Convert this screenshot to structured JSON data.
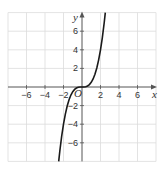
{
  "chart_data": {
    "type": "line",
    "title": "",
    "xlabel": "x",
    "ylabel": "y",
    "origin_label": "O",
    "xlim": [
      -8,
      8
    ],
    "ylim": [
      -8,
      8
    ],
    "grid": true,
    "grid_step": 2,
    "x_ticks": [
      -6,
      -4,
      -2,
      2,
      4,
      6
    ],
    "y_ticks": [
      -6,
      -4,
      -2,
      2,
      4,
      6
    ],
    "x_tick_labels": [
      "−6",
      "−4",
      "−2",
      "2",
      "4",
      "6"
    ],
    "y_tick_labels": [
      "−6",
      "−4",
      "−2",
      "2",
      "4",
      "6"
    ],
    "series": [
      {
        "name": "y = 0.5x³",
        "function": "0.5*x^3",
        "x": [
          -2.52,
          -2.4,
          -2.2,
          -2.0,
          -1.8,
          -1.6,
          -1.4,
          -1.2,
          -1.0,
          -0.8,
          -0.6,
          -0.4,
          -0.2,
          0,
          0.2,
          0.4,
          0.6,
          0.8,
          1.0,
          1.2,
          1.4,
          1.6,
          1.8,
          2.0,
          2.2,
          2.4,
          2.52
        ],
        "y": [
          -8.0,
          -6.91,
          -5.32,
          -4.0,
          -2.92,
          -2.05,
          -1.37,
          -0.86,
          -0.5,
          -0.26,
          -0.11,
          -0.03,
          0.0,
          0,
          0.0,
          0.03,
          0.11,
          0.26,
          0.5,
          0.86,
          1.37,
          2.05,
          2.92,
          4.0,
          5.32,
          6.91,
          8.0
        ]
      }
    ]
  }
}
